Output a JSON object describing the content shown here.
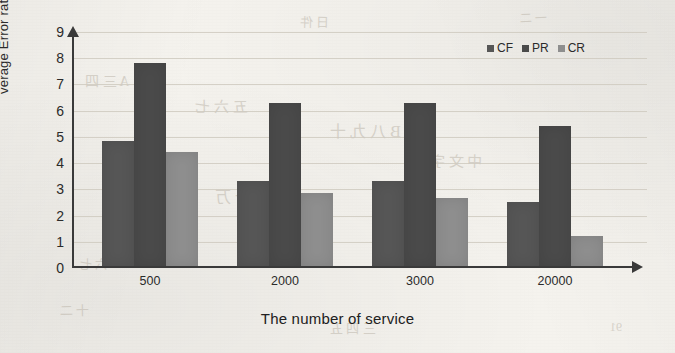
{
  "chart_data": {
    "type": "bar",
    "title": "",
    "xlabel": "The number of service",
    "ylabel": "verage Error rate(%)",
    "categories": [
      "500",
      "2000",
      "3000",
      "20000"
    ],
    "series": [
      {
        "name": "CF",
        "color": "#565656",
        "values": [
          4.75,
          3.25,
          3.25,
          2.45
        ]
      },
      {
        "name": "PR",
        "color": "#4a4a4a",
        "values": [
          7.75,
          6.2,
          6.2,
          5.35
        ]
      },
      {
        "name": "CR",
        "color": "#8e8e8e",
        "values": [
          4.35,
          2.8,
          2.6,
          1.15
        ]
      }
    ],
    "ylim": [
      0,
      9
    ],
    "yticks": [
      0,
      1,
      2,
      3,
      4,
      5,
      6,
      7,
      8,
      9
    ],
    "grid": true,
    "legend_position": "top-right"
  },
  "axes": {
    "y_axis_title": "verage Error rate(%)",
    "x_axis_title": "The number of service"
  },
  "legend": {
    "items": [
      {
        "label": "CF"
      },
      {
        "label": "PR"
      },
      {
        "label": "CR"
      }
    ]
  },
  "background": {
    "ghost_marks": [
      {
        "text": "日 件",
        "x": 300,
        "y": 12,
        "size": 13,
        "rot": -1
      },
      {
        "text": "一 二",
        "x": 520,
        "y": 8,
        "size": 12,
        "rot": 2
      },
      {
        "text": "A 三 四",
        "x": 85,
        "y": 70,
        "size": 14,
        "rot": 0
      },
      {
        "text": "五 六 七",
        "x": 195,
        "y": 95,
        "size": 15,
        "rot": 1
      },
      {
        "text": "B 八 九 十",
        "x": 330,
        "y": 118,
        "size": 16,
        "rot": 0
      },
      {
        "text": "DEF",
        "x": 150,
        "y": 148,
        "size": 17,
        "rot": 0
      },
      {
        "text": "中 文 字",
        "x": 430,
        "y": 150,
        "size": 15,
        "rot": -1
      },
      {
        "text": "百 千 万",
        "x": 215,
        "y": 183,
        "size": 16,
        "rot": 0
      },
      {
        "text": "GHI JK",
        "x": 395,
        "y": 205,
        "size": 14,
        "rot": 0
      },
      {
        "text": "十 二",
        "x": 60,
        "y": 300,
        "size": 13,
        "rot": 1
      },
      {
        "text": "三 四 五",
        "x": 330,
        "y": 318,
        "size": 13,
        "rot": 0
      },
      {
        "text": "91",
        "x": 610,
        "y": 320,
        "size": 12,
        "rot": 0
      },
      {
        "text": "六 七",
        "x": 80,
        "y": 255,
        "size": 12,
        "rot": 0
      },
      {
        "text": "八",
        "x": 560,
        "y": 250,
        "size": 12,
        "rot": 0
      }
    ]
  },
  "colors": {
    "paper": "#f5f3ee",
    "axis": "#3a3a3a",
    "grid": "#cfcabf",
    "cf": "#565656",
    "pr": "#4a4a4a",
    "cr": "#8e8e8e"
  }
}
